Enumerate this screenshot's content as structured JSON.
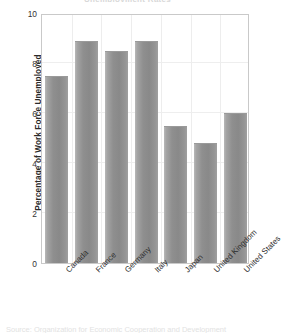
{
  "chart_data": {
    "type": "bar",
    "title": "",
    "xlabel": "",
    "ylabel": "Percentage of Work Force Unemployed",
    "categories": [
      "Canada",
      "France",
      "Germany",
      "Italy",
      "Japan",
      "United Kingdom",
      "United States"
    ],
    "values": [
      7.5,
      8.9,
      8.5,
      8.9,
      5.5,
      4.8,
      6.0
    ],
    "ylim": [
      0,
      10
    ],
    "yticks": [
      0,
      2,
      4,
      6,
      8,
      10
    ],
    "ytick_labels": [
      "0",
      "2",
      "4",
      "6",
      "8",
      "10"
    ],
    "grid": "light horizontal and vertical category gridlines",
    "legend": "none",
    "bar_color": "#8f8f8f",
    "frame_color": "#c9c9c9",
    "series": [
      {
        "name": "Percentage of Work Force Unemployed",
        "values": [
          7.5,
          8.9,
          8.5,
          8.9,
          5.5,
          4.8,
          6.0
        ]
      }
    ]
  },
  "figure": {
    "title_remnant": "Unemployment Rates",
    "caption_remnant": "Source: Organization for Economic Cooperation and Development"
  }
}
